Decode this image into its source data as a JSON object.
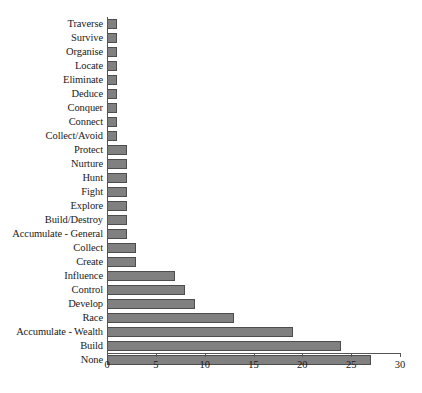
{
  "chart_data": {
    "type": "bar",
    "orientation": "horizontal",
    "title": "",
    "xlabel": "",
    "ylabel": "",
    "xlim": [
      0,
      30
    ],
    "xticks": [
      0,
      5,
      10,
      15,
      20,
      25,
      30
    ],
    "grid": false,
    "legend": false,
    "bar_color": "#808080",
    "bar_border_color": "#4d4d4d",
    "axis_color": "#555555",
    "categories": [
      "Traverse",
      "Survive",
      "Organise",
      "Locate",
      "Eliminate",
      "Deduce",
      "Conquer",
      "Connect",
      "Collect/Avoid",
      "Protect",
      "Nurture",
      "Hunt",
      "Fight",
      "Explore",
      "Build/Destroy",
      "Accumulate - General",
      "Collect",
      "Create",
      "Influence",
      "Control",
      "Develop",
      "Race",
      "Accumulate - Wealth",
      "Build",
      "None"
    ],
    "values": [
      1,
      1,
      1,
      1,
      1,
      1,
      1,
      1,
      1,
      2,
      2,
      2,
      2,
      2,
      2,
      2,
      3,
      3,
      7,
      8,
      9,
      13,
      19,
      24,
      27
    ]
  }
}
